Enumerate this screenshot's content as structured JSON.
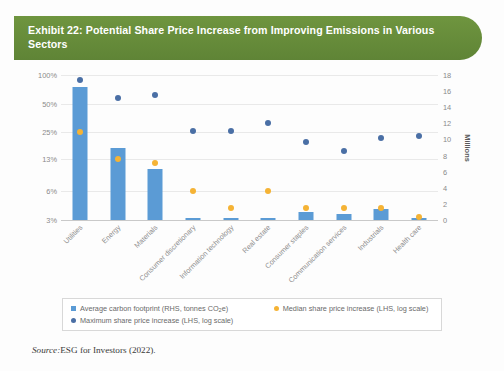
{
  "exhibit": {
    "title": "Exhibit 22: Potential Share Price Increase from Improving Emissions in Various Sectors",
    "source_label": "Source:",
    "source_text": "ESG for Investors (2022)."
  },
  "colors": {
    "banner": "#6f953f",
    "bar": "#5b9bd5",
    "max_marker": "#4a6fa5",
    "median_marker": "#f5b335"
  },
  "legend": {
    "items": [
      {
        "label": "Average carbon footprint (RHS, tonnes CO",
        "sub": "2",
        "tail": "e)",
        "color": "#5b9bd5",
        "shape": "square"
      },
      {
        "label": "Median share price increase (LHS, log scale)",
        "sub": "",
        "tail": "",
        "color": "#f5b335",
        "shape": "circle"
      },
      {
        "label": "Maximum share price increase (LHS, log scale)",
        "sub": "",
        "tail": "",
        "color": "#4a6fa5",
        "shape": "circle"
      }
    ]
  },
  "chart_data": {
    "type": "bar",
    "title": "Exhibit 22: Potential Share Price Increase from Improving Emissions in Various Sectors",
    "xlabel": "",
    "ylabel": "",
    "y2label": "Millions",
    "grid": true,
    "legend_position": "bottom",
    "categories": [
      "Utilities",
      "Energy",
      "Materials",
      "Consumer discretionary",
      "Information technology",
      "Real estate",
      "Consumer staples",
      "Communication services",
      "Industrials",
      "Health care"
    ],
    "y_left": {
      "scale": "log",
      "unit": "%",
      "ticks": [
        3,
        6,
        13,
        25,
        50,
        100
      ],
      "tick_labels": [
        "3%",
        "6%",
        "13%",
        "25%",
        "50%",
        "100%"
      ],
      "ylim": [
        3,
        100
      ]
    },
    "y_right": {
      "scale": "linear",
      "label": "Millions",
      "ticks": [
        0,
        2,
        4,
        6,
        8,
        10,
        12,
        14,
        16,
        18
      ],
      "tick_labels": [
        "0",
        "2",
        "4",
        "6",
        "8",
        "10",
        "12",
        "14",
        "16",
        "18"
      ],
      "ylim": [
        0,
        18
      ]
    },
    "series": [
      {
        "name": "Average carbon footprint (RHS, tonnes CO2e)",
        "type": "bar",
        "axis": "right",
        "unit": "millions tonnes CO2e",
        "color": "#5b9bd5",
        "values": [
          16.5,
          9.0,
          6.3,
          0.3,
          0.2,
          0.3,
          1.0,
          0.8,
          1.4,
          0.3
        ]
      },
      {
        "name": "Maximum share price increase (LHS, log scale)",
        "type": "scatter",
        "axis": "left",
        "unit": "%",
        "color": "#4a6fa5",
        "values": [
          88,
          57,
          62,
          26,
          26,
          31,
          20,
          16,
          22,
          23
        ]
      },
      {
        "name": "Median share price increase (LHS, log scale)",
        "type": "scatter",
        "axis": "left",
        "unit": "%",
        "color": "#f5b335",
        "values": [
          25,
          13,
          12,
          6,
          4,
          6,
          4,
          4,
          4,
          3.2
        ]
      }
    ]
  }
}
